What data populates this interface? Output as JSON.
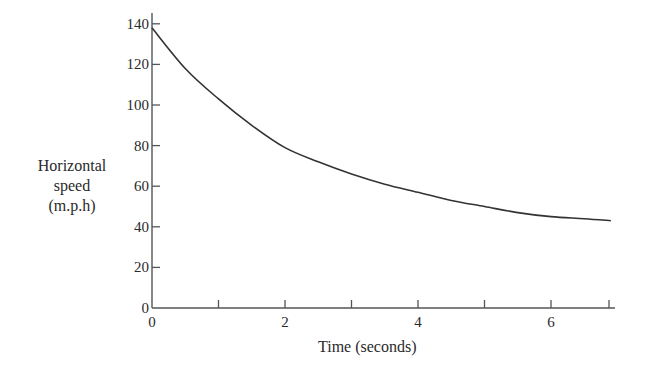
{
  "chart_data": {
    "type": "line",
    "title": "",
    "xlabel": "Time (seconds)",
    "ylabel_lines": [
      "Horizontal",
      "speed",
      "(m.p.h)"
    ],
    "ylabel": "Horizontal speed (m.p.h)",
    "x": [
      0,
      0.5,
      1,
      1.5,
      2,
      2.5,
      3,
      3.5,
      4,
      4.5,
      5,
      5.5,
      6,
      6.5,
      6.9
    ],
    "series": [
      {
        "name": "Horizontal speed",
        "values": [
          138,
          118,
          103,
          90,
          79,
          72,
          66,
          61,
          57,
          53,
          50,
          47,
          45,
          44,
          43
        ]
      }
    ],
    "xlim": [
      0,
      6.9
    ],
    "ylim": [
      0,
      140
    ],
    "xticks": [
      0,
      1,
      2,
      3,
      4,
      5,
      6,
      7
    ],
    "xtick_labels": [
      "0",
      "",
      "2",
      "",
      "4",
      "",
      "6",
      ""
    ],
    "yticks": [
      0,
      20,
      40,
      60,
      80,
      100,
      120,
      140
    ],
    "ytick_labels": [
      "0",
      "20",
      "40",
      "60",
      "80",
      "100",
      "120",
      "140"
    ],
    "grid": false,
    "legend": null
  },
  "colors": {
    "line": "#333333",
    "axis": "#555555",
    "text": "#2a2a2a"
  }
}
